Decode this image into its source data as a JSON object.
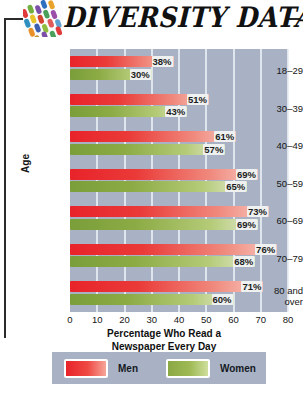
{
  "header": {
    "title": "DIVERSITY DATA",
    "icon": "mosaic-tiles-icon"
  },
  "legend": {
    "men_label": "Men",
    "women_label": "Women"
  },
  "colors": {
    "plot_background": "#a8b2c4",
    "gridline": "#e9edf3",
    "men_bar": "#e8232a",
    "women_bar": "#7a9e3a",
    "page_background": "#ffffff",
    "text": "#161616"
  },
  "chart_data": {
    "type": "bar",
    "orientation": "horizontal",
    "title": "DIVERSITY DATA",
    "xlabel": "Percentage Who Read a Newspaper Every Day",
    "xlabel_line1": "Percentage Who Read a",
    "xlabel_line2": "Newspaper Every Day",
    "ylabel": "Age",
    "categories": [
      "18–29",
      "30–39",
      "40–49",
      "50–59",
      "60–69",
      "70–79",
      "80 and over"
    ],
    "category_lines": [
      [
        "18–29"
      ],
      [
        "30–39"
      ],
      [
        "40–49"
      ],
      [
        "50–59"
      ],
      [
        "60–69"
      ],
      [
        "70–79"
      ],
      [
        "80 and",
        "over"
      ]
    ],
    "series": [
      {
        "name": "Men",
        "color": "#e8232a",
        "values": [
          38,
          51,
          61,
          69,
          73,
          76,
          71
        ],
        "labels": [
          "38%",
          "51%",
          "61%",
          "69%",
          "73%",
          "76%",
          "71%"
        ]
      },
      {
        "name": "Women",
        "color": "#7a9e3a",
        "values": [
          30,
          43,
          57,
          65,
          69,
          68,
          60
        ],
        "labels": [
          "30%",
          "43%",
          "57%",
          "65%",
          "69%",
          "68%",
          "60%"
        ]
      }
    ],
    "xlim": [
      0,
      80
    ],
    "xticks": [
      0,
      10,
      20,
      30,
      40,
      50,
      60,
      70,
      80
    ],
    "xtick_labels": [
      "0",
      "10",
      "20",
      "30",
      "40",
      "50",
      "60",
      "70",
      "80"
    ],
    "grid": true,
    "grid_axis": "x",
    "legend_position": "bottom",
    "value_unit": "%"
  }
}
